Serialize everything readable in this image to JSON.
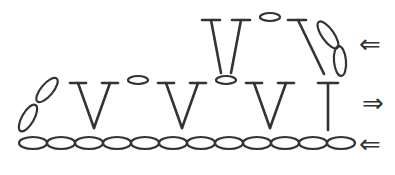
{
  "diagram": {
    "type": "crochet-stitch-chart",
    "colors": {
      "ink": "#333333",
      "background": "#ffffff"
    },
    "rows": [
      {
        "name": "foundation-chain",
        "stitch": "chain",
        "count": 12,
        "direction": "left"
      },
      {
        "name": "row-1",
        "stitches": [
          "turning-chain-2",
          "v-stitch",
          "chain-1",
          "v-stitch",
          "chain-1",
          "v-stitch",
          "double-crochet"
        ],
        "direction": "right"
      },
      {
        "name": "row-2",
        "stitches": [
          "turning-chain-2",
          "double-crochet",
          "chain-1",
          "v-stitch"
        ],
        "direction": "left"
      }
    ],
    "arrows": [
      {
        "row": "row-2",
        "glyph": "⇐"
      },
      {
        "row": "row-1",
        "glyph": "⇒"
      },
      {
        "row": "foundation-chain",
        "glyph": "⇐"
      }
    ]
  }
}
